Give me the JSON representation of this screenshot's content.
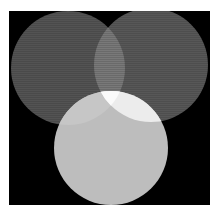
{
  "diagram": {
    "type": "venn",
    "background": {
      "x": 9,
      "y": 11,
      "width": 201,
      "height": 194,
      "color": "#000000"
    },
    "circles": [
      {
        "id": "left",
        "cx": 68,
        "cy": 68,
        "r": 57,
        "color": "#4a4a4a"
      },
      {
        "id": "right",
        "cx": 151,
        "cy": 65,
        "r": 57,
        "color": "#4e4e4e"
      },
      {
        "id": "bottom",
        "cx": 111,
        "cy": 148,
        "r": 57,
        "color": "#bdbdbd"
      }
    ],
    "overlaps": {
      "left_right": "#6a6a6a",
      "left_bottom": "#c6c6c6",
      "right_bottom": "#ececec",
      "all_three": "#fafafa"
    }
  }
}
